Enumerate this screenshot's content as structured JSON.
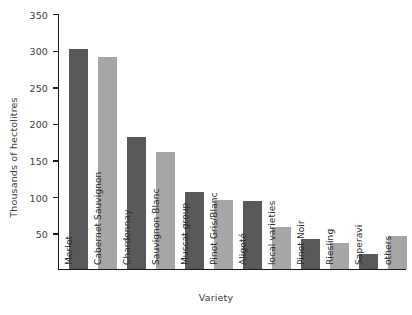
{
  "chart_data": {
    "type": "bar",
    "title": "",
    "xlabel": "Variety",
    "ylabel": "Thousands of hectolitres",
    "categories": [
      "Merlot",
      "Cabernet Sauvignon",
      "Chardonnay",
      "Sauvignon Blanc",
      "Muscat group",
      "Pinot Gris/Blanc",
      "Aligoté",
      "local varieties",
      "Pinot Noir",
      "Riesling",
      "Saperavi",
      "others"
    ],
    "values": [
      301,
      290,
      181,
      160,
      105,
      94,
      93,
      57,
      41,
      35,
      21,
      45
    ],
    "ylim": [
      0,
      350
    ],
    "yticks": [
      50,
      100,
      150,
      200,
      250,
      300,
      350
    ],
    "ytick_labels": [
      "50",
      "100",
      "150",
      "200",
      "250",
      "300",
      "350"
    ],
    "grid": false,
    "legend": null,
    "bar_colors": [
      "#595959",
      "#a6a6a6",
      "#595959",
      "#a6a6a6",
      "#595959",
      "#a6a6a6",
      "#595959",
      "#a6a6a6",
      "#595959",
      "#a6a6a6",
      "#595959",
      "#a6a6a6"
    ],
    "axis_color": "#1c1c1c",
    "text_color": "#3d3d3d",
    "background": "#ffffff"
  }
}
